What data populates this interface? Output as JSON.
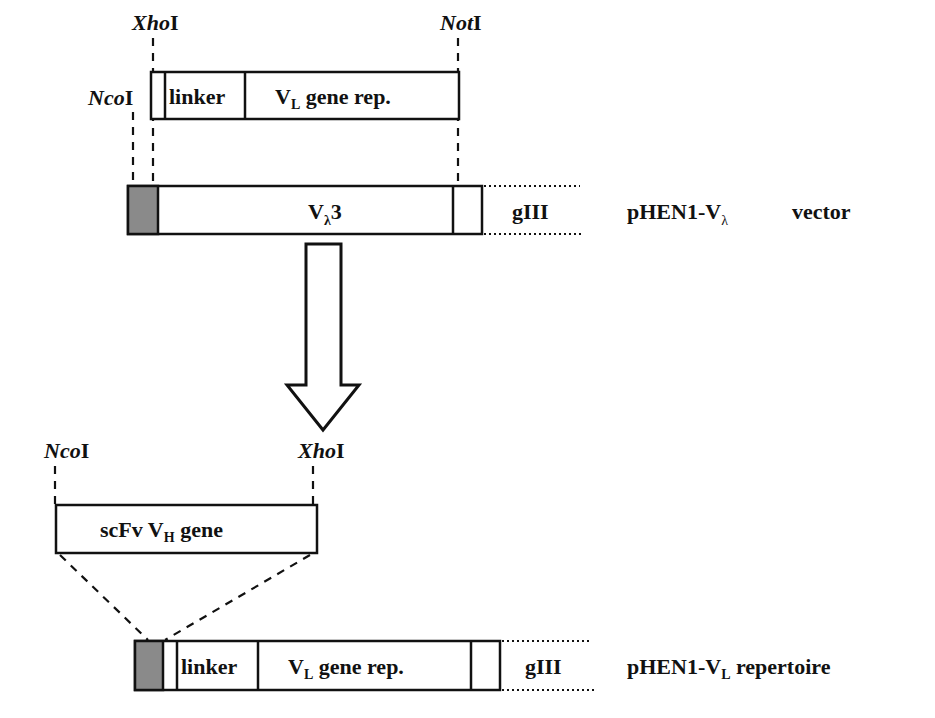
{
  "diagram": {
    "insert_top": {
      "sites": {
        "left": "Xho",
        "left_suffix": "I",
        "right": "Not",
        "right_suffix": "I"
      },
      "segments": {
        "linker": "linker",
        "vl_main": "V",
        "vl_sub": "L",
        "vl_rest": " gene rep."
      }
    },
    "vector": {
      "site_left": "Nco",
      "site_left_suffix": "I",
      "segment_main": "V",
      "segment_sub": "λ",
      "segment_rest": "3",
      "gene": "gIII",
      "name_main": "pHEN1-V",
      "name_sub": "λ",
      "name_rest": "vector"
    },
    "transfer_arrow": "down-arrow",
    "insert_bottom": {
      "sites": {
        "left": "Nco",
        "left_suffix": "I",
        "right": "Xho",
        "right_suffix": "I"
      },
      "label_main": "scFv V",
      "label_sub": "H",
      "label_rest": " gene"
    },
    "repertoire": {
      "segments": {
        "linker": "linker",
        "vl_main": "V",
        "vl_sub": "L",
        "vl_rest": " gene rep."
      },
      "gene": "gIII",
      "name_main": "pHEN1-V",
      "name_sub": "L",
      "name_rest": " repertoire"
    },
    "colors": {
      "stroke": "#111111",
      "tag_fill": "#8a8a8a",
      "background": "#ffffff"
    }
  }
}
